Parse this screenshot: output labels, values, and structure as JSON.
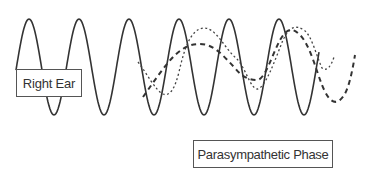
{
  "labels": {
    "right_ear": "Right Ear",
    "parasympathetic_phase": "Parasympathetic Phase"
  },
  "colors": {
    "line": "#333333",
    "box_border": "#555555",
    "background": "#ffffff"
  },
  "waves": [
    {
      "name": "right-ear-signal",
      "style": "solid",
      "x_start": 16,
      "x_end": 319,
      "period": 50,
      "amplitude": 48,
      "center_y": 67
    },
    {
      "name": "dashed-wave",
      "style": "dashed",
      "x_start": 143,
      "x_end": 355
    },
    {
      "name": "dotted-wave",
      "style": "dotted",
      "x_start": 138,
      "x_end": 320
    }
  ]
}
